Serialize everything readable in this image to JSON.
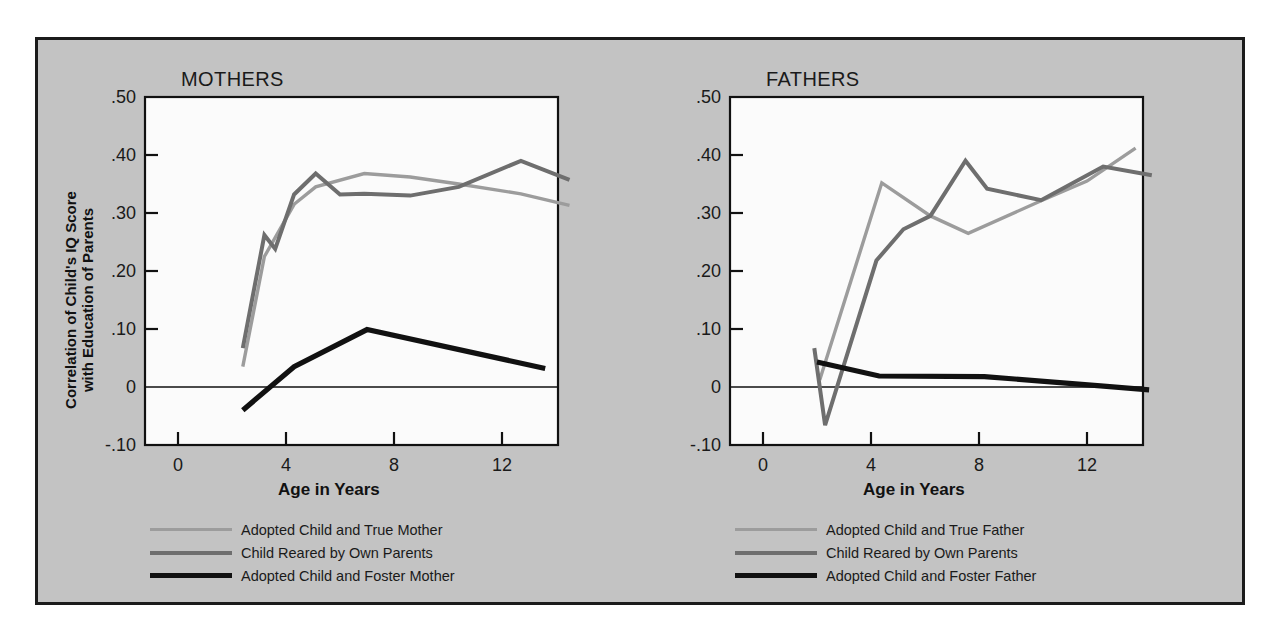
{
  "figure": {
    "background": "#ffffff",
    "panel_background": "#c3c3c3",
    "border_color": "#1b1b1b",
    "plot_background": "#fbfbfb"
  },
  "colors": {
    "true_parent": "#9c9c9c",
    "own_parents": "#6e6e6e",
    "foster_parent": "#111111",
    "axis": "#111111",
    "text": "#1a1a1a"
  },
  "shared": {
    "ylabel_line1": "Correlation of Child's IQ Score",
    "ylabel_line2": "with Education of Parents",
    "xlabel": "Age in Years",
    "y_ticks": [
      "-.10",
      "0",
      ".10",
      ".20",
      ".30",
      ".40",
      ".50"
    ],
    "x_ticks": [
      "0",
      "4",
      "8",
      "12",
      "16"
    ]
  },
  "chart_data": [
    {
      "type": "line",
      "title": "MOTHERS",
      "xlabel": "Age in Years",
      "ylabel": "Correlation of Child's IQ Score with Education of Parents",
      "xlim": [
        0,
        16
      ],
      "ylim": [
        -0.1,
        0.5
      ],
      "xticks": [
        0,
        4,
        8,
        12,
        16
      ],
      "yticks": [
        -0.1,
        0,
        0.1,
        0.2,
        0.3,
        0.4,
        0.5
      ],
      "grid": false,
      "legend_position": "below-left",
      "series": [
        {
          "name": "Adopted Child and True Mother",
          "color": "#9c9c9c",
          "x": [
            2.4,
            3.2,
            4.3,
            5.1,
            6.9,
            8.6,
            10.4,
            12.7,
            14.5
          ],
          "y": [
            0.035,
            0.225,
            0.315,
            0.345,
            0.368,
            0.362,
            0.35,
            0.333,
            0.313
          ]
        },
        {
          "name": "Child Reared by Own Parents",
          "color": "#6e6e6e",
          "x": [
            2.4,
            3.2,
            3.6,
            4.3,
            5.1,
            6.0,
            6.9,
            8.6,
            10.4,
            12.7,
            14.5
          ],
          "y": [
            0.067,
            0.262,
            0.238,
            0.332,
            0.368,
            0.332,
            0.333,
            0.33,
            0.345,
            0.39,
            0.357
          ]
        },
        {
          "name": "Adopted Child and Foster Mother",
          "color": "#111111",
          "x": [
            2.4,
            4.3,
            7.0,
            13.6
          ],
          "y": [
            -0.04,
            0.035,
            0.099,
            0.032
          ]
        }
      ]
    },
    {
      "type": "line",
      "title": "FATHERS",
      "xlabel": "Age in Years",
      "ylabel": "Correlation of Child's IQ Score with Education of Parents",
      "xlim": [
        0,
        16
      ],
      "ylim": [
        -0.1,
        0.5
      ],
      "xticks": [
        0,
        4,
        8,
        12,
        16
      ],
      "yticks": [
        -0.1,
        0,
        0.1,
        0.2,
        0.3,
        0.4,
        0.5
      ],
      "grid": false,
      "legend_position": "below-left",
      "series": [
        {
          "name": "Adopted Child and True Father",
          "color": "#9c9c9c",
          "x": [
            2.1,
            4.4,
            6.2,
            7.6,
            10.3,
            12.0,
            13.8
          ],
          "y": [
            0.012,
            0.352,
            0.295,
            0.265,
            0.321,
            0.355,
            0.412
          ]
        },
        {
          "name": "Child Reared by Own Parents",
          "color": "#6e6e6e",
          "x": [
            1.9,
            2.3,
            4.2,
            5.2,
            6.2,
            7.5,
            8.3,
            10.3,
            12.6,
            14.4
          ],
          "y": [
            0.067,
            -0.066,
            0.218,
            0.272,
            0.295,
            0.39,
            0.342,
            0.322,
            0.38,
            0.365
          ]
        },
        {
          "name": "Adopted Child and Foster Father",
          "color": "#111111",
          "x": [
            2.0,
            4.3,
            8.2,
            12.5,
            14.3
          ],
          "y": [
            0.043,
            0.019,
            0.018,
            0.002,
            -0.005
          ]
        }
      ]
    }
  ],
  "panels": [
    {
      "id": "mothers",
      "title": "MOTHERS",
      "legend": [
        {
          "label": "Adopted Child and True Mother",
          "color": "#9c9c9c",
          "weight": 3
        },
        {
          "label": "Child Reared by Own Parents",
          "color": "#6e6e6e",
          "weight": 4
        },
        {
          "label": "Adopted Child and Foster Mother",
          "color": "#111111",
          "weight": 5
        }
      ]
    },
    {
      "id": "fathers",
      "title": "FATHERS",
      "legend": [
        {
          "label": "Adopted Child and True Father",
          "color": "#9c9c9c",
          "weight": 3
        },
        {
          "label": "Child Reared by Own Parents",
          "color": "#6e6e6e",
          "weight": 4
        },
        {
          "label": "Adopted Child and Foster Father",
          "color": "#111111",
          "weight": 5
        }
      ]
    }
  ]
}
